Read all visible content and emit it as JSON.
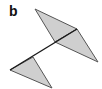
{
  "panel": {
    "label": "b"
  },
  "diagram": {
    "fill_color": "#cfcfcf",
    "edge_color": "#555555",
    "spine_color": "#1a1a1a",
    "shapes": [
      {
        "name": "upper-left-triangle",
        "points": "35,9 77,29 55,42"
      },
      {
        "name": "upper-right-triangle",
        "points": "77,29 55,42 98,62"
      },
      {
        "name": "lower-triangle",
        "points": "10,70 33,57 52,88"
      }
    ],
    "spine": "10,70 77,29"
  }
}
